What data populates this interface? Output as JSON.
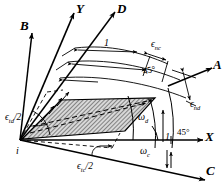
{
  "figure": {
    "background_color": "#ffffff",
    "ink_color": "#000000",
    "hatch_color": "#555555"
  },
  "axes": [
    {
      "name": "B",
      "label": "B",
      "direction_deg": 146,
      "style": "solid-arrow"
    },
    {
      "name": "Y",
      "label": "Y",
      "direction_deg": 90,
      "style": "solid-arrow"
    },
    {
      "name": "D",
      "label": "D",
      "direction_deg": 71,
      "style": "solid-arrow"
    },
    {
      "name": "A",
      "label": "A",
      "direction_deg": 22,
      "style": "solid-arrow"
    },
    {
      "name": "X",
      "label": "X",
      "direction_deg": 0,
      "style": "solid-arrow"
    },
    {
      "name": "C",
      "label": "C",
      "direction_deg": -20,
      "style": "solid-arrow"
    }
  ],
  "origin_label": "i",
  "dimension_labels": {
    "unit_length": "1",
    "unit_length_2": "1"
  },
  "strain_labels": {
    "normal_c": {
      "symbol": "ϵ",
      "sub": "nc",
      "text": "ϵnc"
    },
    "normal_d": {
      "symbol": "ϵ",
      "sub": "nd",
      "text": "ϵnd"
    },
    "shear_c": {
      "symbol": "ϵ",
      "sub": "tc",
      "text": "ϵtc/2",
      "divisor": "/2"
    },
    "shear_d": {
      "symbol": "ϵ",
      "sub": "td",
      "text": "ϵtd/2",
      "divisor": "/2"
    }
  },
  "angle_labels": {
    "omega_c": {
      "symbol": "ω",
      "sub": "c"
    },
    "omega_d": {
      "symbol": "ω",
      "sub": "d"
    },
    "forty_five_upper": "45°",
    "forty_five_lower": "45°"
  },
  "region": {
    "name": "deformed-element",
    "fill": "hatched",
    "description": "shaded parallelogram element"
  }
}
